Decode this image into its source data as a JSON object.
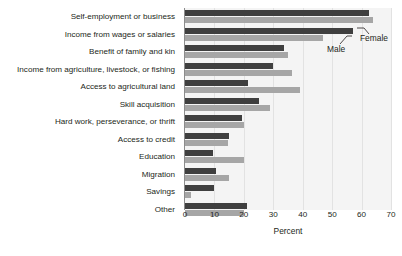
{
  "chart_data": {
    "type": "bar",
    "orientation": "horizontal",
    "title": "",
    "xlabel": "Percent",
    "ylabel": "",
    "xlim": [
      0,
      70
    ],
    "xticks": [
      0,
      10,
      20,
      30,
      40,
      50,
      60,
      70
    ],
    "grid": true,
    "legend_position": "annotation",
    "categories": [
      "Self-employment or business",
      "Income from wages or salaries",
      "Benefit of family and kin",
      "Income from agriculture, livestock, or fishing",
      "Access to agricultural land",
      "Skill acquisition",
      "Hard work, perseverance, or thrift",
      "Access to credit",
      "Education",
      "Migration",
      "Savings",
      "Other"
    ],
    "series": [
      {
        "name": "Male",
        "color": "#3f3f3f",
        "values": [
          62.5,
          57.0,
          33.5,
          30.0,
          21.5,
          25.0,
          19.5,
          15.0,
          9.5,
          10.5,
          10.0,
          21.0
        ]
      },
      {
        "name": "Female",
        "color": "#a6a6a6",
        "values": [
          64.0,
          47.0,
          35.0,
          36.5,
          39.0,
          29.0,
          20.0,
          14.5,
          20.0,
          15.0,
          2.0,
          20.0
        ]
      }
    ],
    "annotations": [
      {
        "label": "Male"
      },
      {
        "label": "Female"
      }
    ]
  }
}
